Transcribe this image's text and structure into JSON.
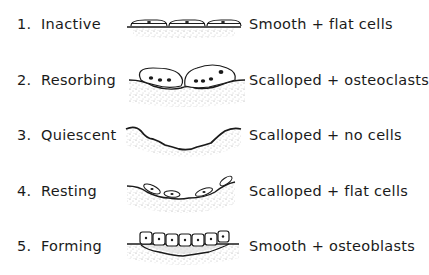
{
  "diagram": {
    "type": "bone-surface-states",
    "rows": [
      {
        "number": "1.",
        "state": "Inactive",
        "description": "Smooth + flat cells",
        "figure": "flat-cells-smooth-surface"
      },
      {
        "number": "2.",
        "state": "Resorbing",
        "description": "Scalloped + osteoclasts",
        "figure": "osteoclasts-on-scalloped-surface"
      },
      {
        "number": "3.",
        "state": "Quiescent",
        "description": "Scalloped + no cells",
        "figure": "empty-scalloped-surface"
      },
      {
        "number": "4.",
        "state": "Resting",
        "description": "Scalloped + flat cells",
        "figure": "flat-cells-scalloped-surface"
      },
      {
        "number": "5.",
        "state": "Forming",
        "description": "Smooth + osteoblasts",
        "figure": "osteoblasts-on-smooth-surface"
      }
    ],
    "colors": {
      "ink": "#1a1a1a",
      "stipple": "#9a9a9a",
      "background": "#ffffff"
    }
  }
}
